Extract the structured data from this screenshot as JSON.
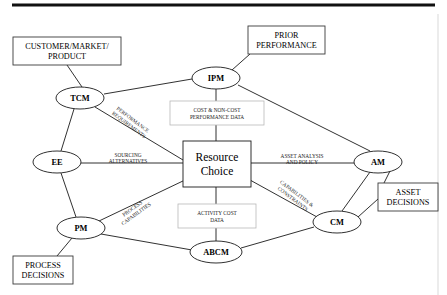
{
  "diagram": {
    "center": {
      "id": "resource-choice",
      "line1": "Resource",
      "line2": "Choice",
      "x": 217,
      "y": 164,
      "w": 68,
      "h": 46
    },
    "nodes": [
      {
        "id": "tcm",
        "label": "TCM",
        "x": 80,
        "y": 98,
        "rx": 24,
        "ry": 11
      },
      {
        "id": "ipm",
        "label": "IPM",
        "x": 216,
        "y": 78,
        "rx": 24,
        "ry": 11
      },
      {
        "id": "ee",
        "label": "EE",
        "x": 57,
        "y": 162,
        "rx": 24,
        "ry": 11
      },
      {
        "id": "am",
        "label": "AM",
        "x": 378,
        "y": 162,
        "rx": 24,
        "ry": 11
      },
      {
        "id": "pm",
        "label": "PM",
        "x": 81,
        "y": 228,
        "rx": 24,
        "ry": 11
      },
      {
        "id": "cm",
        "label": "CM",
        "x": 337,
        "y": 222,
        "rx": 24,
        "ry": 11
      },
      {
        "id": "abcm",
        "label": "ABCM",
        "x": 216,
        "y": 252,
        "rx": 26,
        "ry": 11
      }
    ],
    "boxes": [
      {
        "id": "customer-market-product",
        "lines": [
          "CUSTOMER/MARKET/",
          "PRODUCT"
        ],
        "x": 13,
        "y": 37,
        "w": 108,
        "h": 28
      },
      {
        "id": "prior-performance",
        "lines": [
          "PRIOR",
          "PERFORMANCE"
        ],
        "x": 248,
        "y": 26,
        "w": 77,
        "h": 28
      },
      {
        "id": "asset-decisions",
        "lines": [
          "ASSET",
          "DECISIONS"
        ],
        "x": 378,
        "y": 183,
        "w": 60,
        "h": 28
      },
      {
        "id": "process-decisions",
        "lines": [
          "PROCESS",
          "DECISIONS"
        ],
        "x": 13,
        "y": 256,
        "w": 60,
        "h": 28
      }
    ],
    "annotations": [
      {
        "id": "cost-non-cost-performance-data",
        "lines": [
          "COST & NON-COST",
          "PERFORMANCE DATA"
        ],
        "x": 170,
        "y": 101,
        "w": 94,
        "h": 24
      },
      {
        "id": "activity-cost-data",
        "lines": [
          "ACTIVITY COST",
          "DATA"
        ],
        "x": 178,
        "y": 204,
        "w": 78,
        "h": 24
      }
    ],
    "edge_labels": [
      {
        "id": "performance-requirements",
        "lines": [
          "PERFORMANCE",
          "REQUIREMENTS"
        ],
        "x": 131,
        "y": 122,
        "rotate": 37
      },
      {
        "id": "sourcing-alternatives",
        "lines": [
          "SOURCING",
          "ALTERNATIVES"
        ],
        "x": 128,
        "y": 158,
        "rotate": 0
      },
      {
        "id": "process-capabilities",
        "lines": [
          "PROCESS",
          "CAPABILITIES"
        ],
        "x": 134,
        "y": 211,
        "rotate": -36
      },
      {
        "id": "asset-analysis-and-policy",
        "lines": [
          "ASSET ANALYSIS",
          "AND POLICY"
        ],
        "x": 302,
        "y": 159,
        "rotate": 0
      },
      {
        "id": "capabilities-constraints",
        "lines": [
          "CAPABILITIES &",
          "CONSTRAINTS"
        ],
        "x": 295,
        "y": 196,
        "rotate": 37
      }
    ],
    "edges": [
      {
        "id": "edge-customer-to-tcm",
        "from": "customer-market-product",
        "to": "tcm",
        "path": "M 67,65 L 82,87"
      },
      {
        "id": "edge-prior-to-ipm",
        "from": "prior-performance",
        "to": "ipm",
        "path": "M 250,54 L 232,70"
      },
      {
        "id": "edge-tcm-to-ipm",
        "from": "tcm",
        "to": "ipm",
        "path": "M 104,94 L 192,79"
      },
      {
        "id": "edge-tcm-to-center",
        "from": "tcm",
        "to": "center",
        "path": "M 95,107 L 183,160"
      },
      {
        "id": "edge-tcm-to-ee",
        "from": "tcm",
        "to": "ee",
        "path": "M 74,109 L 61,151"
      },
      {
        "id": "edge-ipm-to-center",
        "from": "ipm",
        "to": "center",
        "path": "M 216,89 L 216,141"
      },
      {
        "id": "edge-ipm-to-am",
        "from": "ipm",
        "to": "am",
        "path": "M 238,85 L 370,151"
      },
      {
        "id": "edge-ee-to-center",
        "from": "ee",
        "to": "center",
        "path": "M 81,163 L 183,163"
      },
      {
        "id": "edge-ee-to-pm",
        "from": "ee",
        "to": "pm",
        "path": "M 61,173 L 76,217"
      },
      {
        "id": "edge-pm-to-center",
        "from": "pm",
        "to": "center",
        "path": "M 99,221 L 185,180"
      },
      {
        "id": "edge-pm-to-abcm",
        "from": "pm",
        "to": "abcm",
        "path": "M 101,234 L 192,250"
      },
      {
        "id": "edge-pm-to-process-dec",
        "from": "pm",
        "to": "process-decisions",
        "path": "M 72,238 L 57,256"
      },
      {
        "id": "edge-center-to-abcm",
        "from": "center",
        "to": "abcm",
        "path": "M 216,187 L 216,241"
      },
      {
        "id": "edge-center-to-am",
        "from": "center",
        "to": "am",
        "path": "M 251,163 L 354,163"
      },
      {
        "id": "edge-center-to-cm",
        "from": "center",
        "to": "cm",
        "path": "M 250,180 L 317,217"
      },
      {
        "id": "edge-abcm-to-cm",
        "from": "abcm",
        "to": "cm",
        "path": "M 241,248 L 314,227"
      },
      {
        "id": "edge-am-to-cm",
        "from": "am",
        "to": "cm",
        "path": "M 370,172 L 342,211"
      },
      {
        "id": "edge-am-to-asset-dec",
        "from": "am",
        "to": "asset-decisions",
        "path": "M 390,171 L 382,187"
      },
      {
        "id": "edge-cm-to-asset-dec",
        "from": "cm",
        "to": "asset-decisions",
        "path": "M 358,217 L 378,199"
      }
    ],
    "rules": [
      {
        "id": "top-rule",
        "x1": 12,
        "y1": 5,
        "x2": 435,
        "y2": 5
      }
    ]
  }
}
